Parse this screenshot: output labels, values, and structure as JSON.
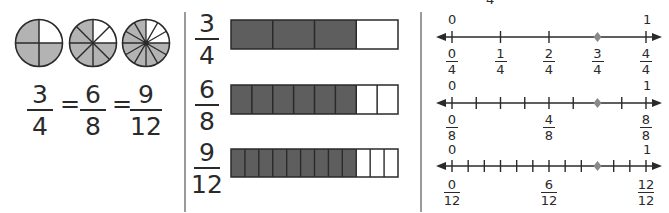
{
  "top_fragment": "4",
  "circles": {
    "items": [
      {
        "parts": 4,
        "shaded": 3
      },
      {
        "parts": 8,
        "shaded": 6
      },
      {
        "parts": 12,
        "shaded": 9
      }
    ],
    "equation": {
      "fractions": [
        {
          "num": "3",
          "den": "4"
        },
        {
          "num": "6",
          "den": "8"
        },
        {
          "num": "9",
          "den": "12"
        }
      ],
      "equals": "="
    }
  },
  "bars": [
    {
      "label": {
        "num": "3",
        "den": "4"
      },
      "parts": 4,
      "shaded": 3
    },
    {
      "label": {
        "num": "6",
        "den": "8"
      },
      "parts": 8,
      "shaded": 6
    },
    {
      "label": {
        "num": "9",
        "den": "12"
      },
      "parts": 12,
      "shaded": 9
    }
  ],
  "number_lines": [
    {
      "start_label": "0",
      "end_label": "1",
      "parts": 4,
      "point": 3,
      "tick_labels": [
        {
          "num": "0",
          "den": "4"
        },
        {
          "num": "1",
          "den": "4"
        },
        {
          "num": "2",
          "den": "4"
        },
        {
          "num": "3",
          "den": "4"
        },
        {
          "num": "4",
          "den": "4"
        }
      ]
    },
    {
      "start_label": "0",
      "end_label": "1",
      "parts": 8,
      "point": 6,
      "tick_labels": [
        {
          "num": "0",
          "den": "8"
        },
        {
          "num": "4",
          "den": "8"
        },
        {
          "num": "8",
          "den": "8"
        }
      ]
    },
    {
      "start_label": "0",
      "end_label": "1",
      "parts": 12,
      "point": 9,
      "tick_labels": [
        {
          "num": "0",
          "den": "12"
        },
        {
          "num": "6",
          "den": "12"
        },
        {
          "num": "12",
          "den": "12"
        }
      ]
    }
  ],
  "colors": {
    "ink": "#2a2a2a",
    "circle_shade": "#b3b3b3",
    "bar_shade": "#5e5e5e",
    "point": "#8a8a8a",
    "divider": "#9a9a9a"
  }
}
